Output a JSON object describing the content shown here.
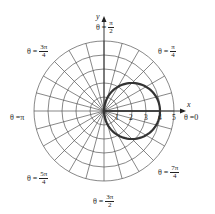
{
  "chart_data": {
    "type": "polar",
    "title": "",
    "curve": {
      "equation": "r = 4 cos(theta)",
      "theta_start_deg": -20,
      "theta_end_deg": 180,
      "color": "#333333",
      "stroke_width": 2.2
    },
    "grid": {
      "rings": [
        1,
        2,
        3,
        4,
        5
      ],
      "spoke_step_deg": 15,
      "color": "#555555"
    },
    "axis_ticks": [
      "1",
      "2",
      "3",
      "4",
      "5"
    ],
    "axis_labels": {
      "x": "x",
      "y": "y"
    },
    "angle_labels": [
      {
        "id": "0",
        "prefix": "θ = ",
        "whole": "0"
      },
      {
        "id": "pi_4",
        "prefix": "θ = ",
        "num": "π",
        "den": "4"
      },
      {
        "id": "pi_2",
        "prefix": "θ = ",
        "num": "π",
        "den": "2"
      },
      {
        "id": "3pi_4",
        "prefix": "θ = ",
        "num": "3π",
        "den": "4"
      },
      {
        "id": "pi",
        "prefix": "θ = ",
        "whole": "π"
      },
      {
        "id": "5pi_4",
        "prefix": "θ = ",
        "num": "5π",
        "den": "4"
      },
      {
        "id": "3pi_2",
        "prefix": "θ = ",
        "num": "3π",
        "den": "2"
      },
      {
        "id": "7pi_4",
        "prefix": "θ = ",
        "num": "7π",
        "den": "4"
      }
    ]
  }
}
